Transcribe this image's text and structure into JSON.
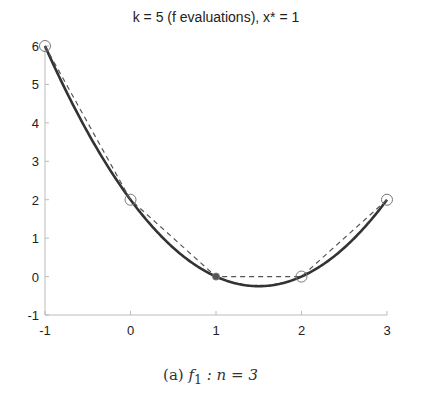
{
  "chart_data": {
    "type": "line",
    "title": "k = 5 (f evaluations), x* = 1",
    "xlabel": "",
    "ylabel": "",
    "xlim": [
      -1,
      3
    ],
    "ylim": [
      -1,
      6
    ],
    "grid": false,
    "x_ticks": [
      "-1",
      "0",
      "1",
      "2",
      "3"
    ],
    "y_ticks": [
      "-1",
      "0",
      "1",
      "2",
      "3",
      "4",
      "5",
      "6"
    ],
    "series": [
      {
        "name": "f(x)",
        "style": "solid",
        "color": "#333333",
        "function": "x^2 - 3x + 2",
        "x": [
          -1,
          -0.5,
          0,
          0.5,
          1,
          1.5,
          2,
          2.5,
          3
        ],
        "y": [
          6,
          3.75,
          2,
          0.75,
          0,
          -0.25,
          0,
          0.75,
          2
        ]
      },
      {
        "name": "evaluations",
        "style": "dashed",
        "color": "#555555",
        "x": [
          -1,
          0,
          1,
          2,
          3
        ],
        "y": [
          6,
          2,
          0,
          0,
          2
        ]
      }
    ],
    "markers": [
      {
        "x": -1,
        "y": 6,
        "type": "open"
      },
      {
        "x": 0,
        "y": 2,
        "type": "open"
      },
      {
        "x": 1,
        "y": 0,
        "type": "filled"
      },
      {
        "x": 2,
        "y": 0,
        "type": "open"
      },
      {
        "x": 3,
        "y": 2,
        "type": "open"
      }
    ]
  },
  "caption": {
    "label": "(a)",
    "func": "f",
    "sub": "1",
    "rest": ": n = 3"
  }
}
